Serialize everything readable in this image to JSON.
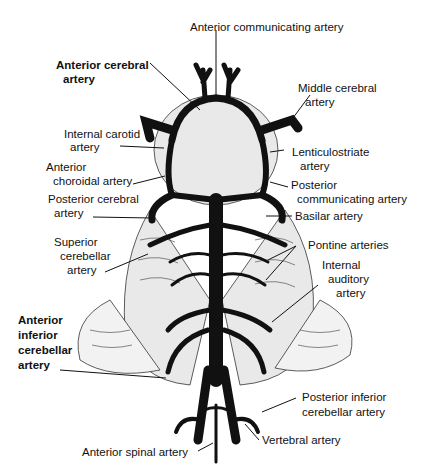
{
  "diagram": {
    "colors": {
      "ink": "#111111",
      "background": "#ffffff",
      "tissue": "#bdbdbd"
    },
    "labels": {
      "anterior_communicating": "Anterior communicating artery",
      "anterior_cerebral_1": "Anterior cerebral",
      "anterior_cerebral_2": "artery",
      "middle_cerebral_1": "Middle cerebral",
      "middle_cerebral_2": "artery",
      "internal_carotid_1": "Internal carotid",
      "internal_carotid_2": "artery",
      "lenticulostriate_1": "Lenticulostriate",
      "lenticulostriate_2": "artery",
      "anterior_choroidal_1": "Anterior",
      "anterior_choroidal_2": "choroidal artery",
      "posterior_communicating_1": "Posterior",
      "posterior_communicating_2": "communicating artery",
      "posterior_cerebral_1": "Posterior cerebral",
      "posterior_cerebral_2": "artery",
      "basilar": "Basilar artery",
      "superior_cerebellar_1": "Superior",
      "superior_cerebellar_2": "cerebellar",
      "superior_cerebellar_3": "artery",
      "pontine": "Pontine arteries",
      "internal_auditory_1": "Internal",
      "internal_auditory_2": "auditory",
      "internal_auditory_3": "artery",
      "aica_1": "Anterior",
      "aica_2": "inferior",
      "aica_3": "cerebellar",
      "aica_4": "artery",
      "pica_1": "Posterior inferior",
      "pica_2": "cerebellar artery",
      "vertebral": "Vertebral artery",
      "anterior_spinal": "Anterior spinal artery"
    }
  }
}
